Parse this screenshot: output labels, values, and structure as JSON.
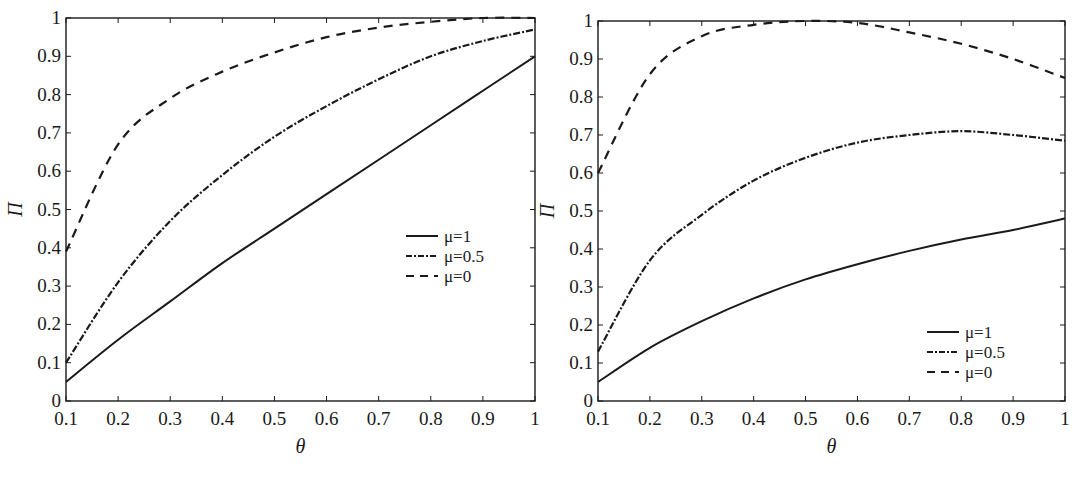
{
  "chart_data": [
    {
      "type": "line",
      "title": "",
      "xlabel": "θ",
      "ylabel": "Π",
      "xlim": [
        0.1,
        1
      ],
      "ylim": [
        0,
        1
      ],
      "grid": false,
      "legend_position": "center-right",
      "x": [
        0.1,
        0.2,
        0.3,
        0.4,
        0.5,
        0.6,
        0.7,
        0.8,
        0.9,
        1.0
      ],
      "xticks": [
        "0.1",
        "0.2",
        "0.3",
        "0.4",
        "0.5",
        "0.6",
        "0.7",
        "0.8",
        "0.9",
        "1"
      ],
      "yticks": [
        "0",
        "0.1",
        "0.2",
        "0.3",
        "0.4",
        "0.5",
        "0.6",
        "0.7",
        "0.8",
        "0.9",
        "1"
      ],
      "series": [
        {
          "name": "μ=1",
          "style": "solid",
          "values": [
            0.05,
            0.16,
            0.26,
            0.36,
            0.45,
            0.54,
            0.63,
            0.72,
            0.81,
            0.9
          ]
        },
        {
          "name": "μ=0.5",
          "style": "dashdot",
          "values": [
            0.1,
            0.31,
            0.47,
            0.59,
            0.69,
            0.77,
            0.84,
            0.9,
            0.94,
            0.97
          ]
        },
        {
          "name": "μ=0",
          "style": "dashed",
          "values": [
            0.39,
            0.67,
            0.79,
            0.86,
            0.91,
            0.95,
            0.975,
            0.99,
            1.0,
            1.0
          ]
        }
      ]
    },
    {
      "type": "line",
      "title": "",
      "xlabel": "θ",
      "ylabel": "Π",
      "xlim": [
        0.1,
        1
      ],
      "ylim": [
        0,
        1
      ],
      "grid": false,
      "legend_position": "lower-right",
      "x": [
        0.1,
        0.2,
        0.3,
        0.4,
        0.5,
        0.6,
        0.7,
        0.8,
        0.9,
        1.0
      ],
      "xticks": [
        "0.1",
        "0.2",
        "0.3",
        "0.4",
        "0.5",
        "0.6",
        "0.7",
        "0.8",
        "0.9",
        "1"
      ],
      "yticks": [
        "0",
        "0.1",
        "0.2",
        "0.3",
        "0.4",
        "0.5",
        "0.6",
        "0.7",
        "0.8",
        "0.9",
        "1"
      ],
      "series": [
        {
          "name": "μ=1",
          "style": "solid",
          "values": [
            0.05,
            0.14,
            0.21,
            0.27,
            0.32,
            0.36,
            0.395,
            0.425,
            0.45,
            0.48
          ]
        },
        {
          "name": "μ=0.5",
          "style": "dashdot",
          "values": [
            0.13,
            0.37,
            0.49,
            0.58,
            0.64,
            0.68,
            0.7,
            0.71,
            0.7,
            0.685
          ]
        },
        {
          "name": "μ=0",
          "style": "dashed",
          "values": [
            0.6,
            0.86,
            0.96,
            0.99,
            1.0,
            0.995,
            0.97,
            0.94,
            0.9,
            0.85
          ]
        }
      ]
    }
  ],
  "colors": {
    "line": "#1a1a1a",
    "background": "#ffffff"
  }
}
